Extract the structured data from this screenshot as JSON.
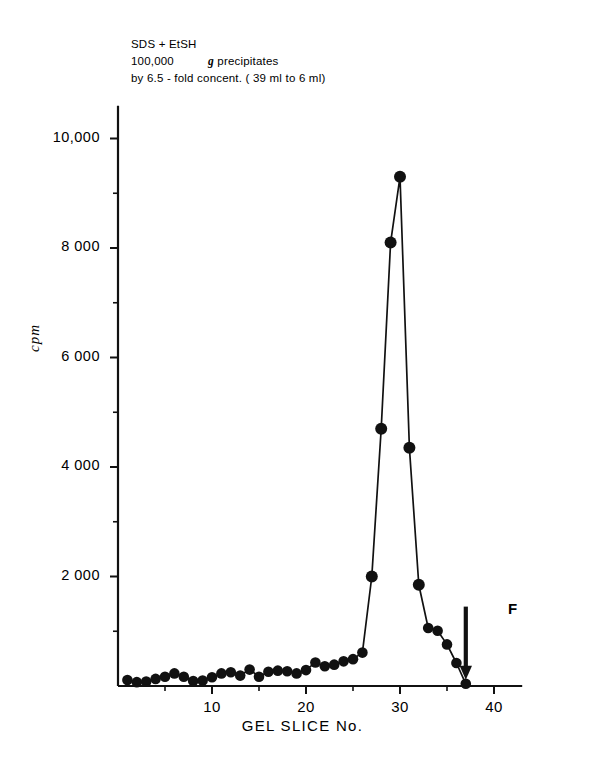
{
  "figure": {
    "annotation": {
      "line1": "SDS + EtSH",
      "line2_prefix": "100,000",
      "line2_italic": "g",
      "line2_suffix": "precipitates",
      "line3": "by 6.5 - fold concent. ( 39 ml to 6 ml)"
    },
    "front_marker": {
      "label": "F",
      "slice": 37
    }
  },
  "chart_data": {
    "type": "line",
    "title": "",
    "subtitle": "",
    "xlabel": "GEL SLICE No.",
    "ylabel": "cpm",
    "xlim": [
      0,
      43
    ],
    "ylim": [
      0,
      10600
    ],
    "grid": false,
    "legend": false,
    "markers": "filled-circle",
    "xticks": [
      10,
      20,
      30,
      40
    ],
    "xtick_labels": [
      "10",
      "20",
      "30",
      "40"
    ],
    "xminor_ticks": [
      5,
      15,
      25,
      35
    ],
    "yticks": [
      2000,
      4000,
      6000,
      8000,
      10000
    ],
    "ytick_labels": [
      "2 000",
      "4 000",
      "6 000",
      "8 000",
      "10,000"
    ],
    "yminor_ticks": [
      1000,
      3000,
      5000,
      7000,
      9000
    ],
    "x": [
      1,
      2,
      3,
      4,
      5,
      6,
      7,
      8,
      9,
      10,
      11,
      12,
      13,
      14,
      15,
      16,
      17,
      18,
      19,
      20,
      21,
      22,
      23,
      24,
      25,
      26,
      27,
      28,
      29,
      30,
      31,
      32,
      33,
      34,
      35,
      36,
      37
    ],
    "values": [
      110,
      70,
      80,
      130,
      170,
      230,
      170,
      90,
      100,
      160,
      230,
      250,
      190,
      300,
      170,
      260,
      280,
      270,
      230,
      290,
      430,
      360,
      390,
      450,
      490,
      610,
      2000,
      4700,
      8100,
      9300,
      4350,
      1850,
      1060,
      1010,
      760,
      420,
      40
    ],
    "series": [
      {
        "name": "cpm",
        "values": [
          110,
          70,
          80,
          130,
          170,
          230,
          170,
          90,
          100,
          160,
          230,
          250,
          190,
          300,
          170,
          260,
          280,
          270,
          230,
          290,
          430,
          360,
          390,
          450,
          490,
          610,
          2000,
          4700,
          8100,
          9300,
          4350,
          1850,
          1060,
          1010,
          760,
          420,
          40
        ]
      }
    ],
    "annotations": [
      {
        "text": "F",
        "x": 37,
        "y": 0,
        "note": "dye front arrow marker"
      }
    ]
  },
  "geometry": {
    "x_axis_pixel_origin": 118,
    "x_pixels_per_slice": 9.4,
    "y_axis_pixel_baseline": 686,
    "y_pixels_per_unit": 0.05475
  }
}
